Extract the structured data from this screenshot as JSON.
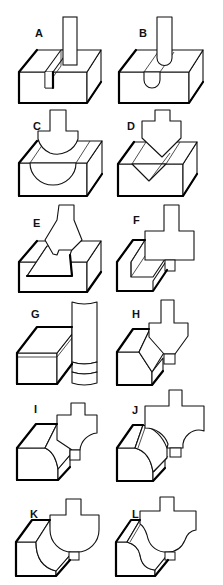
{
  "figure": {
    "panels": [
      {
        "label": "A",
        "profile": "straight-bit"
      },
      {
        "label": "B",
        "profile": "core-box-bit"
      },
      {
        "label": "C",
        "profile": "cove-bit"
      },
      {
        "label": "D",
        "profile": "v-groove-bit"
      },
      {
        "label": "E",
        "profile": "dovetail-bit"
      },
      {
        "label": "F",
        "profile": "rabbeting-bit"
      },
      {
        "label": "G",
        "profile": "flush-trim-bit"
      },
      {
        "label": "H",
        "profile": "chamfer-bit"
      },
      {
        "label": "I",
        "profile": "cove-edge-bit"
      },
      {
        "label": "J",
        "profile": "cove-with-fillet-bit"
      },
      {
        "label": "K",
        "profile": "roundover-bit"
      },
      {
        "label": "L",
        "profile": "ogee-bit"
      }
    ]
  }
}
